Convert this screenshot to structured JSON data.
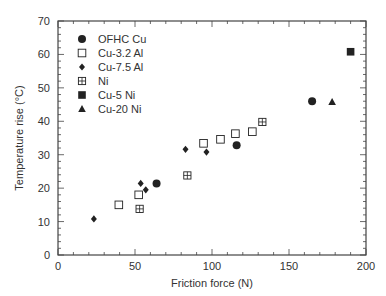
{
  "chart_data": {
    "type": "scatter",
    "title": "",
    "xlabel": "Friction force (N)",
    "ylabel": "Temperature rise (°C)",
    "xlim": [
      0,
      200
    ],
    "ylim": [
      0,
      70
    ],
    "xticks": [
      0,
      50,
      100,
      150,
      200
    ],
    "yticks": [
      0,
      10,
      20,
      30,
      40,
      50,
      60,
      70
    ],
    "x_minor_step": 10,
    "y_minor_step": 2,
    "grid": false,
    "legend_position": "top-left",
    "series": [
      {
        "name": "OFHC Cu",
        "marker": "filled-circle",
        "points": [
          [
            64,
            21.4
          ],
          [
            116,
            32.8
          ],
          [
            165,
            46
          ]
        ]
      },
      {
        "name": "Cu-3.2 Al",
        "marker": "open-square",
        "points": [
          [
            39.5,
            15
          ],
          [
            52.4,
            18
          ],
          [
            94.5,
            33.4
          ],
          [
            105.5,
            34.6
          ],
          [
            115.2,
            36.3
          ],
          [
            126.2,
            36.9
          ]
        ]
      },
      {
        "name": "Cu-7.5 Al",
        "marker": "filled-diamond",
        "points": [
          [
            23.3,
            10.8
          ],
          [
            53.7,
            21.4
          ],
          [
            57,
            19.5
          ],
          [
            82.8,
            31.6
          ],
          [
            96.4,
            30.8
          ]
        ]
      },
      {
        "name": "Ni",
        "marker": "crossed-square",
        "points": [
          [
            53,
            13.8
          ],
          [
            84,
            23.8
          ],
          [
            132.7,
            39.8
          ]
        ]
      },
      {
        "name": "Cu-5 Ni",
        "marker": "filled-square",
        "points": [
          [
            190,
            60.8
          ]
        ]
      },
      {
        "name": "Cu-20 Ni",
        "marker": "filled-triangle",
        "points": [
          [
            178,
            45.8
          ]
        ]
      }
    ]
  },
  "colors": {
    "marker": "#222222",
    "axis": "#444444"
  }
}
